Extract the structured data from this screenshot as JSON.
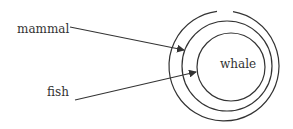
{
  "diagram": {
    "type": "nested-circles (Euler diagram)",
    "labels": {
      "mammal": "mammal",
      "fish": "fish",
      "whale": "whale"
    },
    "circles": [
      {
        "name": "outer-circle",
        "cx": 224,
        "cy": 66,
        "r": 55,
        "gap_at_top": true
      },
      {
        "name": "middle-circle",
        "cx": 227,
        "cy": 66,
        "r": 45
      },
      {
        "name": "inner-circle-whale",
        "cx": 231,
        "cy": 67,
        "r": 34
      }
    ],
    "arrows": [
      {
        "from_label": "mammal",
        "points_to": "region between outer and middle circle"
      },
      {
        "from_label": "fish",
        "points_to": "region between middle and inner circle"
      }
    ],
    "colors": {
      "stroke": "#333333",
      "text": "#333333",
      "background": "#ffffff"
    }
  }
}
